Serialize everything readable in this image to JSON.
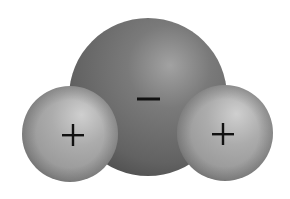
{
  "diagram": {
    "type": "space-filling molecule model",
    "background": "#ffffff",
    "atoms": [
      {
        "id": "oxygen",
        "role": "central atom",
        "charge_symbol": "−",
        "cx": 148,
        "cy": 97,
        "r": 79,
        "base_color": "#6a6a6a",
        "highlight_color": "#a2a2a2",
        "shadow_color": "#4e4e4e"
      },
      {
        "id": "hydrogen-left",
        "role": "hydrogen atom",
        "charge_symbol": "+",
        "cx": 70,
        "cy": 134,
        "r": 48,
        "base_color": "#a3a3a3",
        "highlight_color": "#cfcfcf",
        "shadow_color": "#858585"
      },
      {
        "id": "hydrogen-right",
        "role": "hydrogen atom",
        "charge_symbol": "+",
        "cx": 225,
        "cy": 133,
        "r": 48,
        "base_color": "#a3a3a3",
        "highlight_color": "#cfcfcf",
        "shadow_color": "#858585"
      }
    ],
    "symbols": [
      {
        "id": "minus",
        "label": "−",
        "cx": 148,
        "cy": 99,
        "width": 23
      },
      {
        "id": "plus-left",
        "label": "+",
        "cx": 73,
        "cy": 135,
        "size": 22
      },
      {
        "id": "plus-right",
        "label": "+",
        "cx": 223,
        "cy": 134,
        "size": 22
      }
    ],
    "symbol_color": "#111111"
  }
}
